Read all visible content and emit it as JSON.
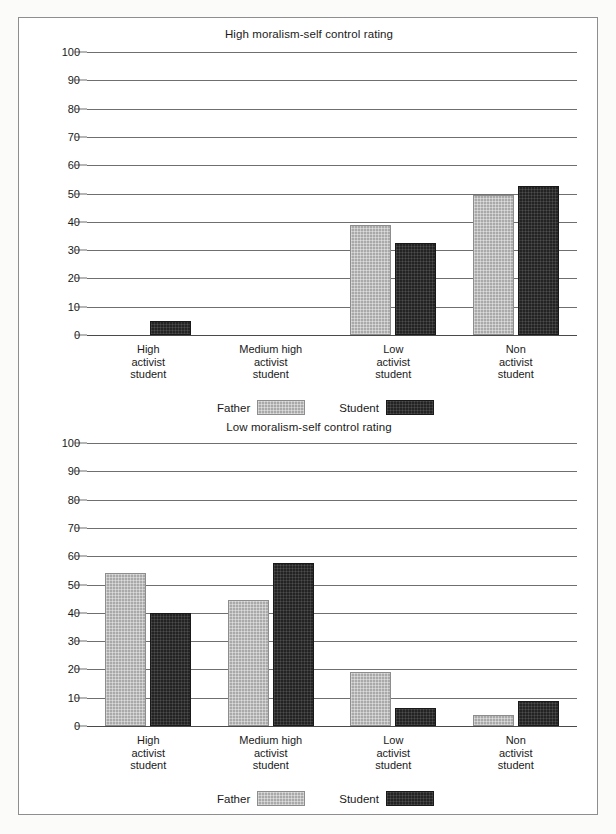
{
  "figure": {
    "background_color": "#ffffff",
    "frame_color": "#8e8e8e",
    "father_color": "#a9a9a9",
    "student_color": "#232323"
  },
  "legend": {
    "father_label": "Father",
    "student_label": "Student"
  },
  "chart_data": [
    {
      "type": "bar",
      "title": "High moralism-self control rating",
      "xlabel": "",
      "ylabel": "",
      "ylim": [
        0,
        100
      ],
      "yticks": [
        0,
        10,
        20,
        30,
        40,
        50,
        60,
        70,
        80,
        90,
        100
      ],
      "grid": true,
      "legend_position": "bottom-center",
      "categories": [
        "High\nactivist\nstudent",
        "Medium high\nactivist\nstudent",
        "Low\nactivist\nstudent",
        "Non\nactivist\nstudent"
      ],
      "series": [
        {
          "name": "Father",
          "values": [
            0,
            0,
            39,
            49.5
          ]
        },
        {
          "name": "Student",
          "values": [
            5,
            0,
            32.5,
            52.5
          ]
        }
      ]
    },
    {
      "type": "bar",
      "title": "Low moralism-self control rating",
      "xlabel": "",
      "ylabel": "",
      "ylim": [
        0,
        100
      ],
      "yticks": [
        0,
        10,
        20,
        30,
        40,
        50,
        60,
        70,
        80,
        90,
        100
      ],
      "grid": true,
      "legend_position": "bottom-center",
      "categories": [
        "High\nactivist\nstudent",
        "Medium high\nactivist\nstudent",
        "Low\nactivist\nstudent",
        "Non\nactivist\nstudent"
      ],
      "series": [
        {
          "name": "Father",
          "values": [
            54,
            44.5,
            19,
            4
          ]
        },
        {
          "name": "Student",
          "values": [
            40,
            57.5,
            6.5,
            9
          ]
        }
      ]
    }
  ]
}
